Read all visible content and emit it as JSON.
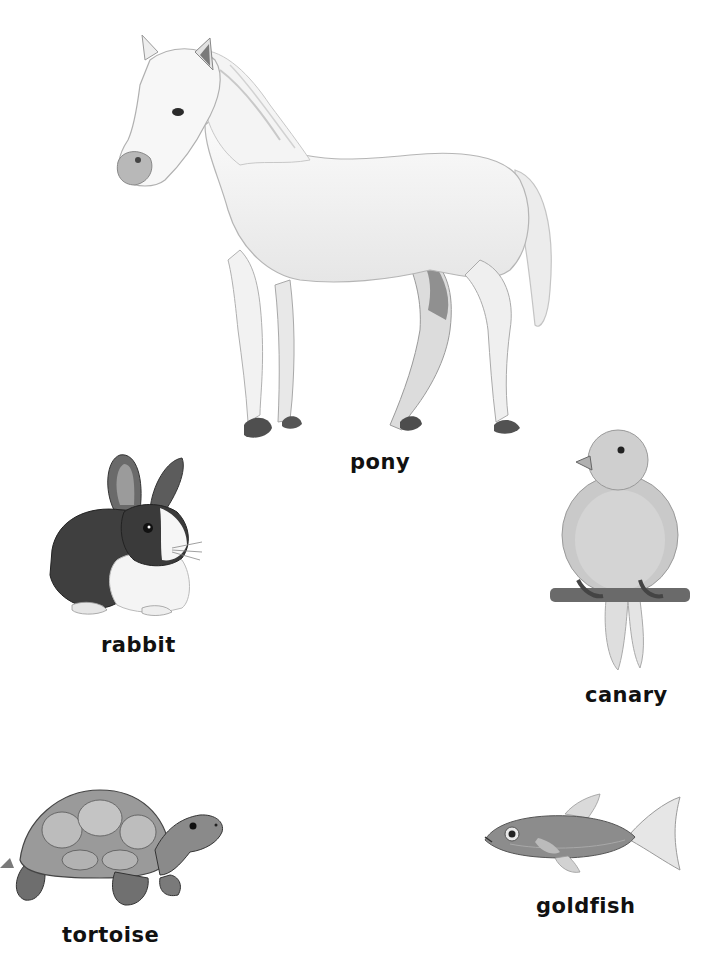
{
  "page": {
    "background": "#ffffff",
    "text_color": "#111111"
  },
  "animals": [
    {
      "id": "pony",
      "label": "pony",
      "icon": "pony-illustration"
    },
    {
      "id": "rabbit",
      "label": "rabbit",
      "icon": "rabbit-illustration"
    },
    {
      "id": "canary",
      "label": "canary",
      "icon": "canary-illustration"
    },
    {
      "id": "tortoise",
      "label": "tortoise",
      "icon": "tortoise-illustration"
    },
    {
      "id": "goldfish",
      "label": "goldfish",
      "icon": "goldfish-illustration"
    }
  ]
}
